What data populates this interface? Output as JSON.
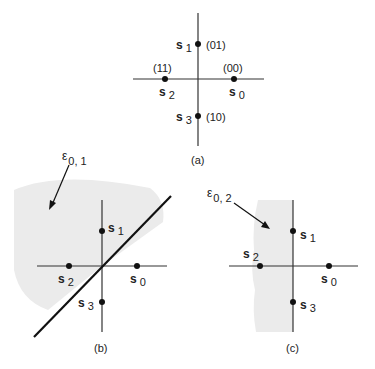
{
  "figure": {
    "panels": [
      {
        "id": "a",
        "caption": "(a)",
        "points": [
          {
            "name": "s",
            "sub": "0",
            "code": "(00)"
          },
          {
            "name": "s",
            "sub": "1",
            "code": "(01)"
          },
          {
            "name": "s",
            "sub": "2",
            "code": "(11)"
          },
          {
            "name": "s",
            "sub": "3",
            "code": "(10)"
          }
        ]
      },
      {
        "id": "b",
        "caption": "(b)",
        "region_label": {
          "symbol": "ε",
          "sub": "0, 1"
        },
        "points": [
          {
            "name": "s",
            "sub": "0"
          },
          {
            "name": "s",
            "sub": "1"
          },
          {
            "name": "s",
            "sub": "2"
          },
          {
            "name": "s",
            "sub": "3"
          }
        ]
      },
      {
        "id": "c",
        "caption": "(c)",
        "region_label": {
          "symbol": "ε",
          "sub": "0, 2"
        },
        "points": [
          {
            "name": "s",
            "sub": "0"
          },
          {
            "name": "s",
            "sub": "1"
          },
          {
            "name": "s",
            "sub": "2"
          },
          {
            "name": "s",
            "sub": "3"
          }
        ]
      }
    ],
    "colors": {
      "ink": "#222222",
      "shade": "#ebebeb"
    }
  }
}
